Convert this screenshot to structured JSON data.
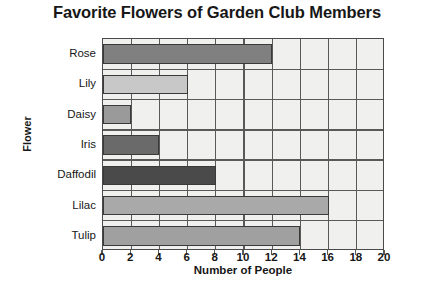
{
  "chart_data": {
    "type": "bar",
    "orientation": "horizontal",
    "title": "Favorite Flowers of Garden Club Members",
    "xlabel": "Number of People",
    "ylabel": "Flower",
    "categories": [
      "Rose",
      "Lily",
      "Daisy",
      "Iris",
      "Daffodil",
      "Lilac",
      "Tulip"
    ],
    "values": [
      12,
      6,
      2,
      4,
      8,
      16,
      14
    ],
    "xlim": [
      0,
      20
    ],
    "xticks": [
      0,
      2,
      4,
      6,
      8,
      10,
      12,
      14,
      16,
      18,
      20
    ],
    "xtick_labels": [
      "0",
      "2",
      "4",
      "6",
      "8",
      "10",
      "12",
      "14",
      "16",
      "18",
      "20"
    ],
    "grid": true,
    "grid_axis": "x",
    "legend": false,
    "bar_colors": [
      "#808080",
      "#c8c8c8",
      "#9a9a9a",
      "#6a6a6a",
      "#4a4a4a",
      "#a9a9a9",
      "#a0a0a0"
    ],
    "plot_background": "#f0f0ef",
    "axis_color": "#4a4a4a",
    "bar_edge_color": "#3a3a3a",
    "text_color": "#171717"
  }
}
